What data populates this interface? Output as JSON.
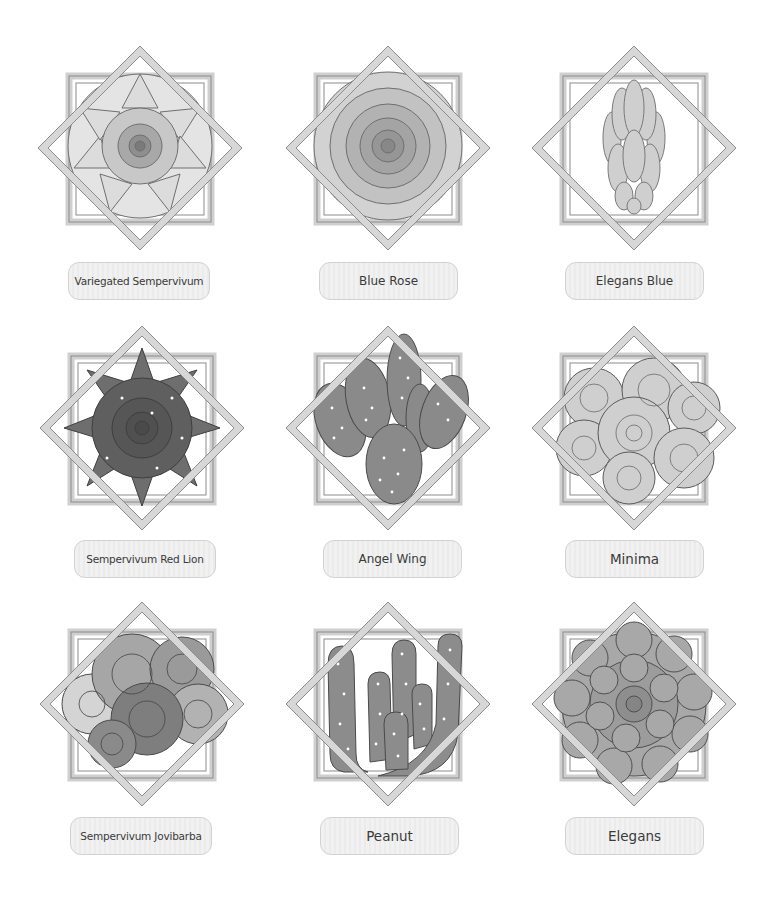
{
  "grid": {
    "columns": 3,
    "rows": 3,
    "frame_color": "#8a8a8a",
    "frame_fill": "#d6d6d6",
    "label_bg": "#efefef",
    "label_border": "#d2d2d2",
    "label_text_color": "#3a3a3a"
  },
  "items": [
    {
      "name": "Variegated Sempervivum",
      "plant": "rosette-light"
    },
    {
      "name": "Blue Rose",
      "plant": "rose"
    },
    {
      "name": "Elegans Blue",
      "plant": "finger-leaves"
    },
    {
      "name": "Sempervivum Red Lion",
      "plant": "rosette-dark"
    },
    {
      "name": "Angel Wing",
      "plant": "prickly-pear"
    },
    {
      "name": "Minima",
      "plant": "clustered-rosettes"
    },
    {
      "name": "Sempervivum Jovibarba",
      "plant": "clustered-spiky"
    },
    {
      "name": "Peanut",
      "plant": "peanut-cactus"
    },
    {
      "name": "Elegans",
      "plant": "echeveria"
    }
  ]
}
